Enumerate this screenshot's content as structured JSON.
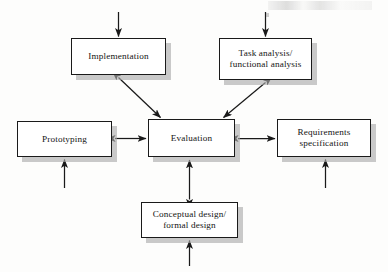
{
  "diagram": {
    "style": {
      "box_fill": "#ffffff",
      "box_border": "#1a1a1a",
      "box_shadow": "#aaaaaa",
      "arrow_color": "#1a1a1a",
      "background": "#fdfdfc",
      "text_color": "#141414"
    },
    "boxes": [
      {
        "id": "implementation",
        "label": "Implementation",
        "x": 71,
        "y": 38,
        "w": 95,
        "h": 37,
        "lines": 1
      },
      {
        "id": "task-analysis",
        "label": "Task analysis/\nfunctional analysis",
        "x": 219,
        "y": 38,
        "w": 93,
        "h": 42,
        "lines": 2
      },
      {
        "id": "prototyping",
        "label": "Prototyping",
        "x": 17,
        "y": 121,
        "w": 95,
        "h": 36,
        "lines": 1
      },
      {
        "id": "evaluation",
        "label": "Evaluation",
        "x": 148,
        "y": 119,
        "w": 87,
        "h": 38,
        "lines": 1
      },
      {
        "id": "requirements-specification",
        "label": "Requirements\nspecification",
        "x": 277,
        "y": 119,
        "w": 94,
        "h": 38,
        "lines": 2
      },
      {
        "id": "conceptual-design",
        "label": "Conceptual design/\nformal design",
        "x": 141,
        "y": 202,
        "w": 97,
        "h": 36,
        "lines": 2
      }
    ],
    "connectors": [
      {
        "id": "implementation-evaluation",
        "from": "implementation",
        "to": "evaluation",
        "heads": "both",
        "orientation": "diagonal"
      },
      {
        "id": "task-analysis-evaluation",
        "from": "task-analysis",
        "to": "evaluation",
        "heads": "both",
        "orientation": "diagonal"
      },
      {
        "id": "prototyping-evaluation",
        "from": "prototyping",
        "to": "evaluation",
        "heads": "both",
        "orientation": "horizontal"
      },
      {
        "id": "evaluation-requirements",
        "from": "evaluation",
        "to": "requirements-specification",
        "heads": "both",
        "orientation": "horizontal"
      },
      {
        "id": "conceptual-design-evaluation",
        "from": "conceptual-design",
        "to": "evaluation",
        "heads": "both",
        "orientation": "vertical"
      }
    ],
    "external_arrows": [
      {
        "id": "into-implementation",
        "target": "implementation",
        "direction": "down",
        "edge": "top"
      },
      {
        "id": "into-task-analysis",
        "target": "task-analysis",
        "direction": "down",
        "edge": "top"
      },
      {
        "id": "into-prototyping",
        "target": "prototyping",
        "direction": "up",
        "edge": "bottom"
      },
      {
        "id": "into-requirements",
        "target": "requirements-specification",
        "direction": "up",
        "edge": "bottom"
      },
      {
        "id": "into-conceptual-design",
        "target": "conceptual-design",
        "direction": "up",
        "edge": "bottom"
      }
    ]
  }
}
